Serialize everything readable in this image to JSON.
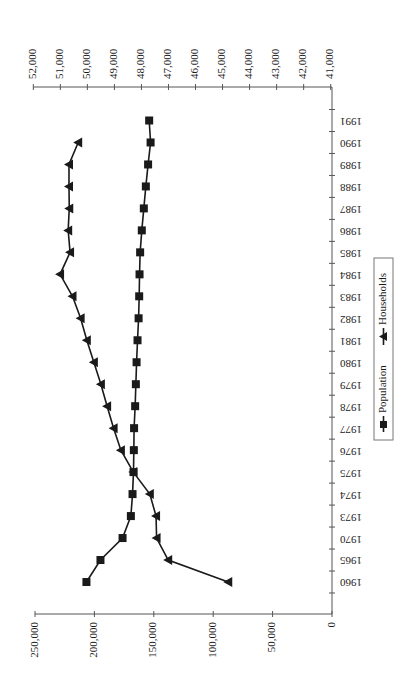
{
  "chart_data": {
    "type": "line",
    "orientation": "rotated-90-clockwise",
    "title": "",
    "xlabel": "",
    "ylabel": "",
    "categories": [
      "1960",
      "1965",
      "1970",
      "1973",
      "1974",
      "1975",
      "1976",
      "1977",
      "1978",
      "1979",
      "1980",
      "1981",
      "1982",
      "1983",
      "1984",
      "1985",
      "1986",
      "1987",
      "1988",
      "1989",
      "1990",
      "1991"
    ],
    "series": [
      {
        "name": "Population",
        "axis": "primary",
        "marker": "square",
        "values": [
          206700,
          194900,
          176300,
          169300,
          167900,
          167100,
          166800,
          166600,
          165700,
          165100,
          164500,
          163700,
          162800,
          162300,
          162000,
          161500,
          160100,
          158400,
          156700,
          154800,
          152700,
          153900
        ]
      },
      {
        "name": "Households",
        "axis": "secondary",
        "marker": "triangle",
        "values": [
          44790,
          47010,
          47440,
          47460,
          47690,
          48300,
          48760,
          49030,
          49270,
          49500,
          49760,
          50020,
          50250,
          50550,
          51010,
          50640,
          50710,
          50670,
          50680,
          50680,
          50340,
          null
        ]
      }
    ],
    "primary_axis": {
      "ylim": [
        0,
        250000
      ],
      "ticks": [
        "0",
        "50,000",
        "100,000",
        "150,000",
        "200,000",
        "250,000"
      ],
      "tick_values": [
        0,
        50000,
        100000,
        150000,
        200000,
        250000
      ]
    },
    "secondary_axis": {
      "ylim": [
        41000,
        52000
      ],
      "ticks": [
        "41,000",
        "42,000",
        "43,000",
        "44,000",
        "45,000",
        "46,000",
        "47,000",
        "48,000",
        "49,000",
        "50,000",
        "51,000",
        "52,000"
      ],
      "tick_values": [
        41000,
        42000,
        43000,
        44000,
        45000,
        46000,
        47000,
        48000,
        49000,
        50000,
        51000,
        52000
      ]
    },
    "grid": false,
    "legend": {
      "position": "right-center",
      "entries": [
        "Population",
        "Households"
      ]
    }
  },
  "colors": {
    "line": "#1a1a1a",
    "axis": "#555555",
    "background": "#ffffff"
  }
}
